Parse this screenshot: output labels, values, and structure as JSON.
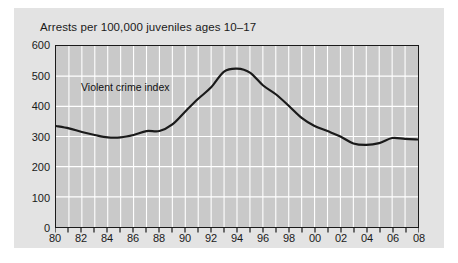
{
  "chart_data": {
    "type": "line",
    "title": "Arrests per 100,000 juveniles ages 10–17",
    "xlabel": "",
    "ylabel": "",
    "ylim": [
      0,
      600
    ],
    "xlim": [
      1980,
      2008
    ],
    "yticks": [
      0,
      100,
      200,
      300,
      400,
      500,
      600
    ],
    "ytick_labels": [
      "0",
      "100",
      "200",
      "300",
      "400",
      "500",
      "600"
    ],
    "xticks": [
      1980,
      1981,
      1982,
      1983,
      1984,
      1985,
      1986,
      1987,
      1988,
      1989,
      1990,
      1991,
      1992,
      1993,
      1994,
      1995,
      1996,
      1997,
      1998,
      1999,
      2000,
      2001,
      2002,
      2003,
      2004,
      2005,
      2006,
      2007,
      2008
    ],
    "xtick_labels": [
      "80",
      "",
      "82",
      "",
      "84",
      "",
      "86",
      "",
      "88",
      "",
      "90",
      "",
      "92",
      "",
      "94",
      "",
      "96",
      "",
      "98",
      "",
      "00",
      "",
      "02",
      "",
      "04",
      "",
      "06",
      "",
      "08"
    ],
    "grid": true,
    "grid_color": "#ffffff",
    "plot_background": "#c9c9c9",
    "figure_background": "#e3e3e3",
    "legend_position": "inline-annotation",
    "annotations": [
      {
        "text": "Violent crime index",
        "x": 1982,
        "y": 450
      }
    ],
    "series": [
      {
        "name": "Violent crime index",
        "color": "#1a1a1a",
        "x": [
          1980,
          1981,
          1982,
          1983,
          1984,
          1985,
          1986,
          1987,
          1988,
          1989,
          1990,
          1991,
          1992,
          1993,
          1994,
          1995,
          1996,
          1997,
          1998,
          1999,
          2000,
          2001,
          2002,
          2003,
          2004,
          2005,
          2006,
          2007,
          2008
        ],
        "values": [
          335,
          327,
          315,
          305,
          297,
          297,
          305,
          318,
          318,
          340,
          383,
          425,
          463,
          515,
          525,
          512,
          470,
          440,
          402,
          362,
          335,
          318,
          300,
          277,
          272,
          278,
          295,
          292,
          290
        ]
      }
    ]
  },
  "chart": {
    "title": "Arrests per 100,000 juveniles ages 10–17",
    "series_label": "Violent crime index"
  }
}
